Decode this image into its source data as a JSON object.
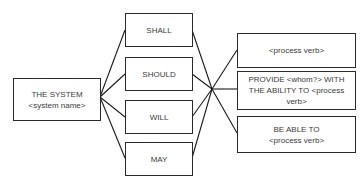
{
  "diagram": {
    "subject": {
      "line1": "THE SYSTEM",
      "line2": "<system name>"
    },
    "modals": [
      {
        "label": "SHALL"
      },
      {
        "label": "SHOULD"
      },
      {
        "label": "WILL"
      },
      {
        "label": "MAY"
      }
    ],
    "predicates": [
      {
        "label": "<process verb>"
      },
      {
        "label": "PROVIDE <whom?> WITH THE ABILITY TO <process verb>"
      },
      {
        "label_line1": "BE ABLE TO",
        "label_line2": "<process verb>"
      }
    ],
    "colors": {
      "line": "#1a1a1a",
      "border": "#2a2a2a",
      "text": "#3a3a3a",
      "background": "#ffffff"
    }
  }
}
